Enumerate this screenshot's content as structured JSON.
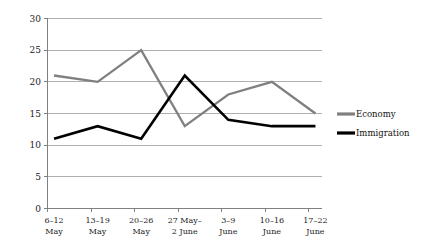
{
  "chart_data": {
    "type": "line",
    "title": "",
    "xlabel": "",
    "ylabel": "",
    "ylim": [
      0,
      30
    ],
    "ytick_step": 5,
    "yticks": [
      "0",
      "5",
      "10",
      "15",
      "20",
      "25",
      "30"
    ],
    "grid": true,
    "legend_position": "right",
    "categories": [
      "6–12 May",
      "13–19 May",
      "20–26 May",
      "27 May– 2 June",
      "3–9 June",
      "10–16 June",
      "17–22 June"
    ],
    "category_lines": [
      [
        "6–12",
        "May"
      ],
      [
        "13–19",
        "May"
      ],
      [
        "20–26",
        "May"
      ],
      [
        "27 May–",
        "2 June"
      ],
      [
        "3–9",
        "June"
      ],
      [
        "10–16",
        "June"
      ],
      [
        "17–22",
        "June"
      ]
    ],
    "series": [
      {
        "name": "Economy",
        "color": "#808080",
        "values": [
          21,
          20,
          25,
          13,
          18,
          20,
          15
        ]
      },
      {
        "name": "Immigration",
        "color": "#000000",
        "values": [
          11,
          13,
          11,
          21,
          14,
          13,
          13
        ]
      }
    ]
  },
  "legend": {
    "items": [
      {
        "label": "Economy",
        "color": "#808080"
      },
      {
        "label": "Immigration",
        "color": "#000000"
      }
    ]
  },
  "colors": {
    "economy": "#808080",
    "immigration": "#000000",
    "gridline": "#a6a6a6",
    "axis": "#808080",
    "text": "#222222",
    "background": "#ffffff"
  }
}
